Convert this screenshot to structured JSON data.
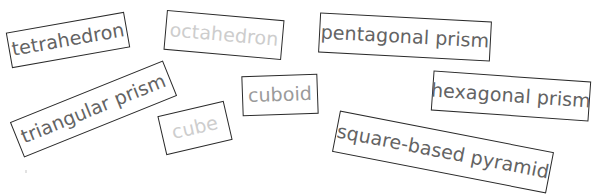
{
  "colors": {
    "background": "#ffffff",
    "border": "#2a2a2a",
    "text_dark": "#636363",
    "text_mid": "#9a9a9a",
    "text_light": "#cdcdcd"
  },
  "cards": [
    {
      "id": "tetrahedron",
      "label": "tetrahedron",
      "cx": 68,
      "cy": 40,
      "w": 120,
      "h": 36,
      "rotate": -10,
      "color": "#636363"
    },
    {
      "id": "octahedron",
      "label": "octahedron",
      "cx": 224,
      "cy": 35,
      "w": 118,
      "h": 40,
      "rotate": 5,
      "color": "#cdcdcd"
    },
    {
      "id": "pentagonal-prism",
      "label": "pentagonal prism",
      "cx": 405,
      "cy": 37,
      "w": 172,
      "h": 40,
      "rotate": 3,
      "color": "#636363"
    },
    {
      "id": "triangular-prism",
      "label": "triangular prism",
      "cx": 93,
      "cy": 109,
      "w": 165,
      "h": 38,
      "rotate": -22,
      "color": "#636363"
    },
    {
      "id": "cuboid",
      "label": "cuboid",
      "cx": 280,
      "cy": 95,
      "w": 76,
      "h": 40,
      "rotate": -2,
      "color": "#9a9a9a"
    },
    {
      "id": "cube",
      "label": "cube",
      "cx": 195,
      "cy": 128,
      "w": 68,
      "h": 40,
      "rotate": -13,
      "color": "#cdcdcd"
    },
    {
      "id": "hexagonal-prism",
      "label": "hexagonal prism",
      "cx": 511,
      "cy": 96,
      "w": 158,
      "h": 40,
      "rotate": 4,
      "color": "#636363"
    },
    {
      "id": "square-based-pyramid",
      "label": "square-based pyramid",
      "cx": 443,
      "cy": 152,
      "w": 218,
      "h": 42,
      "rotate": 11,
      "color": "#636363"
    }
  ]
}
